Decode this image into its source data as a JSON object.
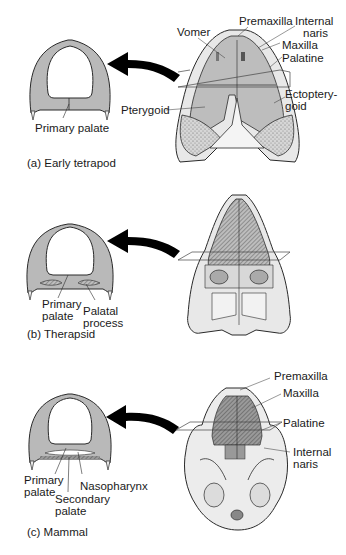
{
  "figure": {
    "panels": [
      {
        "id": "a",
        "caption": "(a) Early tetrapod",
        "cross_section_labels": [
          "Primary palate"
        ],
        "skull_labels": {
          "premaxilla": "Premaxilla",
          "internal_naris_1": "Internal",
          "internal_naris_2": "naris",
          "vomer": "Vomer",
          "maxilla": "Maxilla",
          "palatine": "Palatine",
          "ectopterygoid_1": "Ectoptery-",
          "ectopterygoid_2": "goid",
          "pterygoid": "Pterygoid"
        }
      },
      {
        "id": "b",
        "caption": "(b) Therapsid",
        "cross_section_labels": {
          "primary_palate_1": "Primary",
          "primary_palate_2": "palate",
          "palatal_process_1": "Palatal",
          "palatal_process_2": "process"
        }
      },
      {
        "id": "c",
        "caption": "(c) Mammal",
        "cross_section_labels": {
          "primary_palate_1": "Primary",
          "primary_palate_2": "palate",
          "secondary_palate_1": "Secondary",
          "secondary_palate_2": "palate",
          "nasopharynx": "Nasopharynx"
        },
        "skull_labels": {
          "premaxilla": "Premaxilla",
          "maxilla": "Maxilla",
          "palatine": "Palatine",
          "internal_naris_1": "Internal",
          "internal_naris_2": "naris"
        }
      }
    ],
    "colors": {
      "section_fill": "#b9b9b9",
      "section_stroke": "#2a2a2a",
      "skull_fill": "#bdbdbd",
      "hatch": "#6a6a6a",
      "bone": "#eeeeee",
      "arrow": "#000000"
    }
  }
}
